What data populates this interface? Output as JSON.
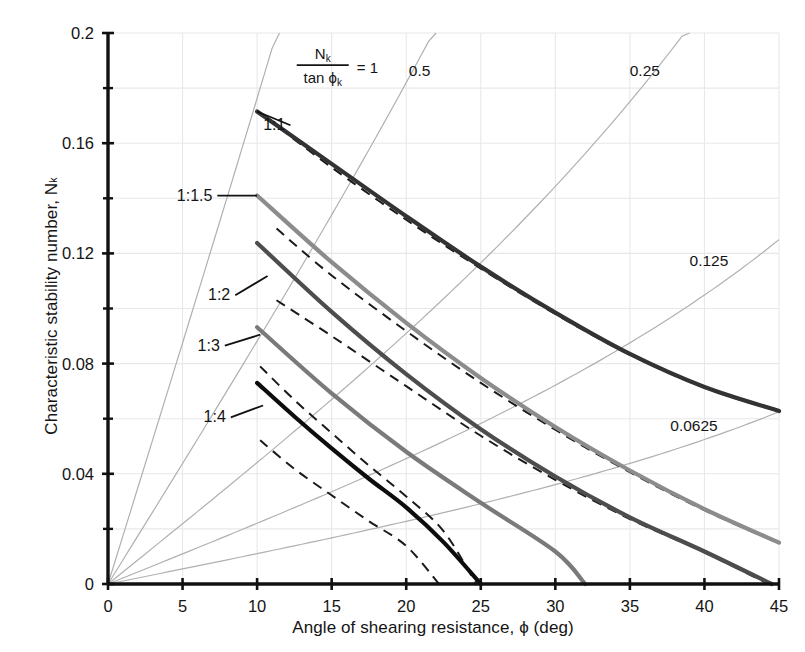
{
  "chart_data": {
    "type": "line",
    "title": "",
    "xlabel": "Angle of shearing resistance, ϕ (deg)",
    "ylabel": "Characteristic stability number, N",
    "ylabel_sub": "k",
    "xlim": [
      0,
      45
    ],
    "ylim": [
      0,
      0.2
    ],
    "xticks": [
      0,
      5,
      10,
      15,
      20,
      25,
      30,
      35,
      40,
      45
    ],
    "xtick_labels": [
      "0",
      "5",
      "10",
      "15",
      "20",
      "25",
      "30",
      "35",
      "40",
      "45"
    ],
    "yticks": [
      0,
      0.04,
      0.08,
      0.12,
      0.16,
      0.2
    ],
    "ytick_labels": [
      "0",
      "0.04",
      "0.08",
      "0.12",
      "0.16",
      "0.2"
    ],
    "yminor_ticks": [
      0.02,
      0.06,
      0.1,
      0.14,
      0.18
    ],
    "grid": true,
    "legend_position": "inline-annotations",
    "annotation_formula": {
      "numerator": "N",
      "numerator_sub": "k",
      "denominator": "tan ϕ",
      "denominator_sub": "k",
      "equals": "= 1"
    },
    "reference_rays": [
      {
        "label": "1",
        "ratio": 1.0,
        "label_x": 27.0,
        "label_y": 0.1885
      },
      {
        "label": "0.5",
        "ratio": 0.5,
        "label_x": 20.9,
        "label_y": 0.1845
      },
      {
        "label": "0.25",
        "ratio": 0.25,
        "label_x": 36.0,
        "label_y": 0.1845
      },
      {
        "label": "0.125",
        "ratio": 0.125,
        "label_x": 40.3,
        "label_y": 0.1155
      },
      {
        "label": "0.0625",
        "ratio": 0.0625,
        "label_x": 39.3,
        "label_y": 0.0555
      }
    ],
    "series": [
      {
        "name": "1:1",
        "label": "1:1",
        "color": "#333333",
        "style": "solid",
        "label_x": 11.9,
        "label_y": 0.1665,
        "leader_to_x": 10.0,
        "leader_to_y": 0.1715,
        "points": [
          [
            10,
            0.1715
          ],
          [
            15,
            0.1525
          ],
          [
            20,
            0.1335
          ],
          [
            25,
            0.1152
          ],
          [
            30,
            0.0985
          ],
          [
            35,
            0.0835
          ],
          [
            40,
            0.0715
          ],
          [
            45,
            0.0628
          ]
        ],
        "dashed_points": [
          [
            11.5,
            0.1655
          ],
          [
            15,
            0.1512
          ],
          [
            20,
            0.1322
          ],
          [
            25,
            0.1145
          ],
          [
            30,
            0.098
          ],
          [
            35,
            0.0832
          ],
          [
            40,
            0.0713
          ],
          [
            45,
            0.0626
          ]
        ]
      },
      {
        "name": "1:1.5",
        "label": "1:1.5",
        "color": "#8c8c8c",
        "style": "solid",
        "label_x": 7.0,
        "label_y": 0.141,
        "leader_to_x": 10.0,
        "leader_to_y": 0.141,
        "points": [
          [
            10,
            0.141
          ],
          [
            15,
            0.1168
          ],
          [
            20,
            0.0948
          ],
          [
            25,
            0.0748
          ],
          [
            30,
            0.057
          ],
          [
            35,
            0.0412
          ],
          [
            40,
            0.0272
          ],
          [
            45,
            0.015
          ]
        ],
        "dashed_points": [
          [
            11.3,
            0.129
          ],
          [
            15,
            0.112
          ],
          [
            20,
            0.0918
          ],
          [
            25,
            0.073
          ],
          [
            30,
            0.056
          ],
          [
            35,
            0.0406
          ],
          [
            40,
            0.0268
          ],
          [
            45,
            0.0148
          ]
        ]
      },
      {
        "name": "1:2",
        "label": "1:2",
        "color": "#4d4d4d",
        "style": "solid",
        "label_x": 8.2,
        "label_y": 0.1048,
        "leader_to_x": 10.7,
        "leader_to_y": 0.1118,
        "points": [
          [
            10,
            0.1238
          ],
          [
            15,
            0.0988
          ],
          [
            20,
            0.0762
          ],
          [
            25,
            0.0562
          ],
          [
            30,
            0.039
          ],
          [
            35,
            0.0242
          ],
          [
            40,
            0.0118
          ],
          [
            44.5,
            0.0
          ]
        ],
        "dashed_points": [
          [
            11.3,
            0.103
          ],
          [
            15,
            0.09
          ],
          [
            20,
            0.0718
          ],
          [
            25,
            0.0538
          ],
          [
            30,
            0.0378
          ],
          [
            35,
            0.0236
          ],
          [
            40,
            0.0115
          ],
          [
            44.3,
            0.0
          ]
        ]
      },
      {
        "name": "1:3",
        "label": "1:3",
        "color": "#7a7a7a",
        "style": "solid",
        "label_x": 7.5,
        "label_y": 0.0865,
        "leader_to_x": 10.2,
        "leader_to_y": 0.0905,
        "points": [
          [
            10,
            0.0932
          ],
          [
            15,
            0.0692
          ],
          [
            20,
            0.048
          ],
          [
            25,
            0.0295
          ],
          [
            30,
            0.0118
          ],
          [
            32,
            0.0
          ]
        ],
        "dashed_points": []
      },
      {
        "name": "1:4",
        "label": "1:4",
        "color": "#0d0d0d",
        "style": "solid",
        "label_x": 7.9,
        "label_y": 0.0605,
        "leader_to_x": 10.4,
        "leader_to_y": 0.0648,
        "points": [
          [
            10,
            0.073
          ],
          [
            12.5,
            0.0608
          ],
          [
            15,
            0.0492
          ],
          [
            17.5,
            0.0382
          ],
          [
            20,
            0.0278
          ],
          [
            22.5,
            0.0152
          ],
          [
            25,
            0.0
          ]
        ],
        "dashed_points": [
          [
            10.2,
            0.079
          ],
          [
            12.5,
            0.0668
          ],
          [
            15,
            0.0548
          ],
          [
            17.5,
            0.043
          ],
          [
            20,
            0.0318
          ],
          [
            22.5,
            0.0192
          ],
          [
            24.7,
            0.0
          ]
        ],
        "dashed_points2": [
          [
            10.2,
            0.0522
          ],
          [
            12.5,
            0.0418
          ],
          [
            15,
            0.0322
          ],
          [
            17.5,
            0.0228
          ],
          [
            20,
            0.0138
          ],
          [
            22.2,
            0.0
          ]
        ]
      }
    ],
    "colors": {
      "axis": "#111111",
      "grid": "#e8e8ec",
      "ray": "#b0b0b0",
      "background": "#ffffff"
    }
  }
}
